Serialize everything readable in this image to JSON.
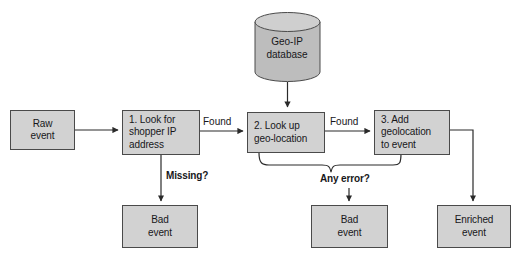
{
  "diagram": {
    "colors": {
      "node_fill": "#d2d2d2",
      "node_stroke": "#4a4a4a",
      "line": "#2a2a2a",
      "text": "#17171a",
      "background": "#ffffff"
    },
    "datastore": {
      "id": "geo-ip-database",
      "label": "Geo-IP\ndatabase",
      "shape": "cylinder"
    },
    "nodes": [
      {
        "id": "raw-event",
        "label": "Raw\nevent",
        "align": "center"
      },
      {
        "id": "step-1",
        "label": "1. Look for\n shopper IP\n address",
        "align": "left"
      },
      {
        "id": "step-2",
        "label": "2. Look up\n geo-location",
        "align": "left"
      },
      {
        "id": "step-3",
        "label": "3. Add\n geolocation\n to event",
        "align": "left"
      },
      {
        "id": "bad-event-1",
        "label": "Bad\nevent",
        "align": "center"
      },
      {
        "id": "bad-event-2",
        "label": "Bad\nevent",
        "align": "center"
      },
      {
        "id": "enriched-event",
        "label": "Enriched\nevent",
        "align": "center"
      }
    ],
    "edge_labels": [
      {
        "id": "found-1",
        "text": "Found",
        "bold": false
      },
      {
        "id": "found-2",
        "text": "Found",
        "bold": false
      },
      {
        "id": "missing",
        "text": "Missing?",
        "bold": true
      },
      {
        "id": "any-error",
        "text": "Any error?",
        "bold": true
      }
    ],
    "edges": [
      {
        "from": "raw-event",
        "to": "step-1",
        "label": ""
      },
      {
        "from": "step-1",
        "to": "step-2",
        "label": "Found"
      },
      {
        "from": "step-2",
        "to": "step-3",
        "label": "Found"
      },
      {
        "from": "step-1",
        "to": "bad-event-1",
        "label": "Missing?"
      },
      {
        "from": "step-2+step-3",
        "to": "bad-event-2",
        "label": "Any error?"
      },
      {
        "from": "geo-ip-database",
        "to": "step-2",
        "label": ""
      },
      {
        "from": "step-3",
        "to": "enriched-event",
        "label": ""
      }
    ]
  }
}
